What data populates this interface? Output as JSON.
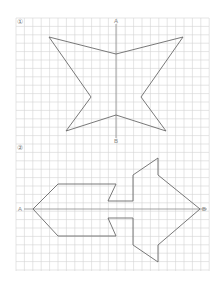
{
  "worksheet": {
    "grid": {
      "x0": 16,
      "y0": 18,
      "x1": 209,
      "y1": 271,
      "cell": 8.4,
      "line_color": "#d4d4d4",
      "bg_color": "#ffffff"
    },
    "figures": [
      {
        "id": "1",
        "label": "①",
        "label_pos": [
          17,
          19
        ],
        "axis": {
          "orientation": "vertical",
          "start_label": "A",
          "end_label": "B",
          "from": [
            116,
            24
          ],
          "to": [
            116,
            138
          ],
          "start_label_pos": [
            114,
            18
          ],
          "end_label_pos": [
            114,
            138
          ]
        },
        "shape": "star",
        "points": [
          [
            49,
            37
          ],
          [
            116,
            54
          ],
          [
            183,
            37
          ],
          [
            141,
            97
          ],
          [
            166,
            131
          ],
          [
            116,
            115
          ],
          [
            66,
            131
          ],
          [
            91,
            97
          ]
        ]
      },
      {
        "id": "2",
        "label": "②",
        "label_pos": [
          17,
          145
        ],
        "axis": {
          "orientation": "horizontal",
          "start_label": "A",
          "end_label": "B",
          "from": [
            24,
            209
          ],
          "to": [
            207,
            209
          ],
          "start_label_pos": [
            18,
            206
          ],
          "end_label_pos": [
            202,
            206
          ]
        },
        "shape": "arrow",
        "points": [
          [
            33,
            209
          ],
          [
            58,
            184
          ],
          [
            116,
            184
          ],
          [
            108,
            201
          ],
          [
            133,
            201
          ],
          [
            133,
            175
          ],
          [
            158,
            158
          ],
          [
            158,
            175
          ],
          [
            200,
            209
          ],
          [
            158,
            245
          ],
          [
            158,
            262
          ],
          [
            133,
            245
          ],
          [
            133,
            218
          ],
          [
            108,
            218
          ],
          [
            116,
            236
          ],
          [
            58,
            236
          ]
        ]
      }
    ],
    "colors": {
      "shape_stroke": "#6a6a6a",
      "axis_stroke": "#8a8a8a",
      "label_color": "#777777"
    }
  }
}
